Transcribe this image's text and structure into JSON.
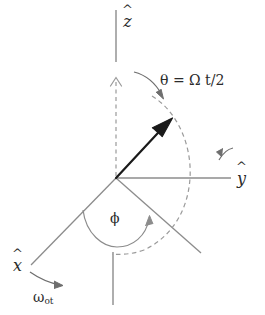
{
  "figure": {
    "background_color": "#ffffff",
    "line_color": "#8c8c8c",
    "vector_color": "#1a1a1a",
    "text_color": "#2b2b2b",
    "width": 265,
    "height": 315
  },
  "labels": {
    "z_axis": {
      "hat": "^",
      "symbol": "z"
    },
    "y_axis": {
      "hat": "^",
      "symbol": "y"
    },
    "x_axis": {
      "hat": "^",
      "symbol": "x"
    },
    "theta_equation": "θ = Ω t/2",
    "phi": "ϕ",
    "omega": "ω",
    "omega_subscript": "ot"
  },
  "elements": [
    {
      "name": "z-axis-line",
      "type": "solid-line",
      "description": "vertical z axis above origin"
    },
    {
      "name": "negative-z-axis-line",
      "type": "solid-line",
      "description": "vertical line below origin"
    },
    {
      "name": "y-axis-line",
      "type": "solid-line",
      "description": "horizontal y axis to the right"
    },
    {
      "name": "x-axis-line",
      "type": "solid-line",
      "description": "line to lower left"
    },
    {
      "name": "fourth-axis-line",
      "type": "solid-line",
      "description": "line to lower right"
    },
    {
      "name": "dashed-vertical-axis",
      "type": "dashed-arrow",
      "description": "dashed vertical reference with arrowhead"
    },
    {
      "name": "theta-arc",
      "type": "dashed-arc",
      "description": "large dashed meridian arc"
    },
    {
      "name": "phi-arc",
      "type": "solid-arc",
      "description": "arc with arrowhead marking azimuthal angle"
    },
    {
      "name": "state-vector",
      "type": "solid-arrow",
      "description": "bold vector from origin up and to the right"
    },
    {
      "name": "theta-pointer-arrow",
      "type": "curved-arrow",
      "description": "curved arrow from theta label to arc"
    },
    {
      "name": "y-rotation-arrow",
      "type": "curved-arrow",
      "description": "curved arrow above y axis"
    },
    {
      "name": "omega-pointer-arrow",
      "type": "curved-arrow",
      "description": "curved arrow from x axis to omega label"
    }
  ]
}
